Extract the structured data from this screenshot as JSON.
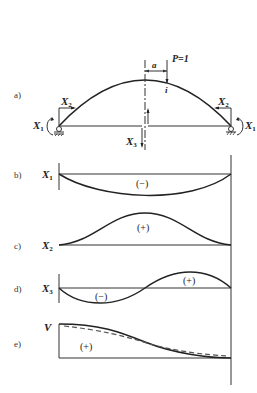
{
  "figure": {
    "panels": [
      {
        "id": "a",
        "label": "a)",
        "description": "Two-hinged tied arch, cut at crown, with redundants",
        "load": {
          "label": "P=1",
          "point_label": "i",
          "offset_label": "a"
        },
        "redundants": {
          "moment_left": {
            "name": "X",
            "sub": "1"
          },
          "moment_right": {
            "name": "X",
            "sub": "1"
          },
          "horizontal_left": {
            "name": "X",
            "sub": "2"
          },
          "horizontal_right": {
            "name": "X",
            "sub": "2"
          },
          "shear": {
            "name": "X",
            "sub": "3"
          }
        }
      },
      {
        "id": "b",
        "label": "b)",
        "quantity": {
          "name": "X",
          "sub": "1"
        },
        "sign": "(−)"
      },
      {
        "id": "c",
        "label": "c)",
        "quantity": {
          "name": "X",
          "sub": "2"
        },
        "sign": "(+)"
      },
      {
        "id": "d",
        "label": "d)",
        "quantity": {
          "name": "X",
          "sub": "3"
        },
        "sign_neg": "(−)",
        "sign_pos": "(+)"
      },
      {
        "id": "e",
        "label": "e)",
        "quantity": {
          "name": "V",
          "sub": ""
        },
        "sign": "(+)"
      }
    ]
  }
}
